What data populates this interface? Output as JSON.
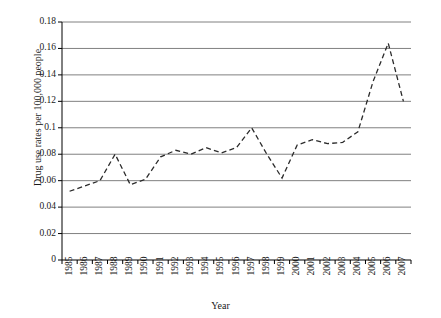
{
  "chart_data": {
    "type": "line",
    "title": "",
    "xlabel": "Year",
    "ylabel": "Drug use rates per 100,000 people",
    "categories": [
      "1985",
      "1986",
      "1987",
      "1988",
      "1989",
      "1990",
      "1991",
      "1992",
      "1993",
      "1994",
      "1995",
      "1996",
      "1997",
      "1998",
      "1999",
      "2000",
      "2001",
      "2002",
      "2003",
      "2004",
      "2005",
      "2006",
      "2007"
    ],
    "values": [
      0.052,
      0.056,
      0.06,
      0.08,
      0.057,
      0.061,
      0.078,
      0.083,
      0.08,
      0.085,
      0.081,
      0.085,
      0.1,
      0.08,
      0.062,
      0.087,
      0.091,
      0.088,
      0.089,
      0.097,
      0.135,
      0.164,
      0.12
    ],
    "series": [
      {
        "name": "Drug use rate",
        "values": [
          0.052,
          0.056,
          0.06,
          0.08,
          0.057,
          0.061,
          0.078,
          0.083,
          0.08,
          0.085,
          0.081,
          0.085,
          0.1,
          0.08,
          0.062,
          0.087,
          0.091,
          0.088,
          0.089,
          0.097,
          0.135,
          0.164,
          0.12
        ],
        "style": "dashed",
        "color": "#2b2b2b"
      }
    ],
    "ylim": [
      0,
      0.18
    ],
    "yticks": [
      0,
      0.02,
      0.04,
      0.06,
      0.08,
      0.1,
      0.12,
      0.14,
      0.16,
      0.18
    ],
    "ytick_labels": [
      "0",
      "0.02",
      "0.04",
      "0.06",
      "0.08",
      "0.1",
      "0.12",
      "0.14",
      "0.16",
      "0.18"
    ],
    "grid": true,
    "grid_color": "#808080",
    "legend": "none",
    "axis_color": "#000000",
    "background": "#ffffff"
  }
}
